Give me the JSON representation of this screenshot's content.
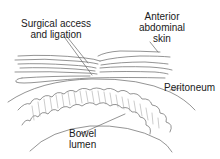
{
  "diagram": {
    "type": "anatomical-cross-section",
    "labels": {
      "surgical_access_line1": "Surgical access",
      "surgical_access_line2": "and ligation",
      "anterior_line1": "Anterior",
      "anterior_line2": "abdominal",
      "anterior_line3": "skin",
      "peritoneum": "Peritoneum",
      "bowel_line1": "Bowel",
      "bowel_line2": "lumen"
    },
    "colors": {
      "stroke": "#555555",
      "text": "#1a1a1a",
      "background": "#ffffff"
    }
  }
}
